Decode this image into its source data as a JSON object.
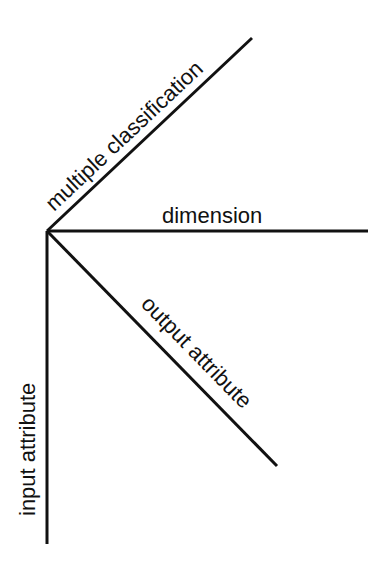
{
  "diagram": {
    "type": "radiating-axes",
    "origin": {
      "x": 47,
      "y": 231
    },
    "colors": {
      "line": "#111111",
      "background": "#ffffff"
    },
    "axes": [
      {
        "id": "multiple-classification",
        "label": "multiple classification",
        "end": {
          "x": 252,
          "y": 38
        }
      },
      {
        "id": "dimension",
        "label": "dimension",
        "end": {
          "x": 368,
          "y": 231
        }
      },
      {
        "id": "output-attribute",
        "label": "output attribute",
        "end": {
          "x": 277,
          "y": 466
        }
      },
      {
        "id": "input-attribute",
        "label": "input attribute",
        "end": {
          "x": 47,
          "y": 544
        }
      }
    ]
  }
}
